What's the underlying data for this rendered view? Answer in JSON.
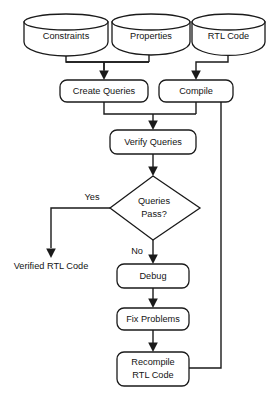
{
  "diagram": {
    "type": "flowchart",
    "background_color": "#ffffff",
    "line_color": "#1a1a1a",
    "text_color": "#141414",
    "nodes": {
      "constraints": {
        "label": "Constraints",
        "shape": "cylinder"
      },
      "properties": {
        "label": "Properties",
        "shape": "cylinder"
      },
      "rtl_code": {
        "label": "RTL Code",
        "shape": "cylinder"
      },
      "create_queries": {
        "label": "Create Queries",
        "shape": "rounded-rect"
      },
      "compile": {
        "label": "Compile",
        "shape": "rounded-rect"
      },
      "verify_queries": {
        "label": "Verify Queries",
        "shape": "rounded-rect"
      },
      "queries_pass": {
        "label_line1": "Queries",
        "label_line2": "Pass?",
        "shape": "diamond"
      },
      "verified_rtl_code": {
        "label": "Verified RTL Code",
        "shape": "text"
      },
      "debug": {
        "label": "Debug",
        "shape": "rounded-rect"
      },
      "fix_problems": {
        "label": "Fix Problems",
        "shape": "rounded-rect"
      },
      "recompile_rtl_code": {
        "label_line1": "Recompile",
        "label_line2": "RTL Code",
        "shape": "rounded-rect"
      }
    },
    "edge_labels": {
      "yes": "Yes",
      "no": "No"
    }
  }
}
